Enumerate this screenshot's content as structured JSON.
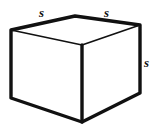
{
  "figure": {
    "name": "cube-with-edge-labels",
    "background_color": "#ffffff",
    "stroke_color": "#111111",
    "fill_color": "#ffffff",
    "labels": {
      "top_left_edge": "s",
      "top_right_edge": "s",
      "right_vertical_edge": "s"
    },
    "geometry": {
      "back_left": "11,30",
      "back_top": "75,16",
      "back_right": "140,25",
      "front_top": "82,45",
      "bottom_left": "11,98",
      "bottom_front": "82,122",
      "bottom_right": "140,93"
    },
    "shape_type": "cube",
    "edge_length_symbol": "s"
  }
}
